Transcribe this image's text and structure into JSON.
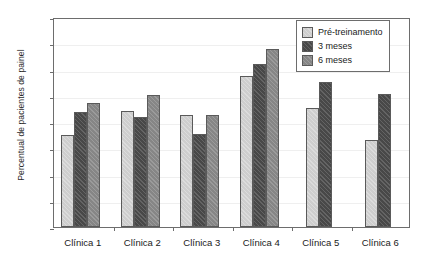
{
  "chart_data": {
    "type": "bar",
    "title": "",
    "xlabel": "",
    "ylabel": "Percentual de pacientes de painel",
    "ylim": [
      0,
      40
    ],
    "ytick_values": [
      0,
      5,
      10,
      15,
      20,
      25,
      30,
      35,
      40
    ],
    "ytick_labels": [
      "0",
      "5",
      "10",
      "15",
      "20",
      "25",
      "30",
      "35",
      "40"
    ],
    "grid": true,
    "grid_axis": "y",
    "legend_position": "top-right",
    "categories": [
      "Clínica 1",
      "Clínica 2",
      "Clínica 3",
      "Clínica 4",
      "Clínica 5",
      "Clínica 6"
    ],
    "series": [
      {
        "name": "Pré-treinamento",
        "color": "#d6d6d6",
        "values": [
          17.6,
          22.1,
          21.3,
          28.8,
          22.7,
          16.6
        ]
      },
      {
        "name": "3 meses",
        "color": "#4b4b4b",
        "values": [
          22.0,
          21.0,
          17.8,
          31.0,
          27.6,
          25.3
        ]
      },
      {
        "name": "6 meses",
        "color": "#8b8b8b",
        "values": [
          23.7,
          25.2,
          21.4,
          33.9,
          null,
          null
        ]
      }
    ]
  },
  "legend": {
    "entries": [
      {
        "label": "Pré-treinamento",
        "swatch": "#d6d6d6"
      },
      {
        "label": "3 meses",
        "swatch": "#4b4b4b"
      },
      {
        "label": "6 meses",
        "swatch": "#8b8b8b"
      }
    ]
  },
  "axes": {
    "y_title": "Percentual de pacientes de painel"
  }
}
